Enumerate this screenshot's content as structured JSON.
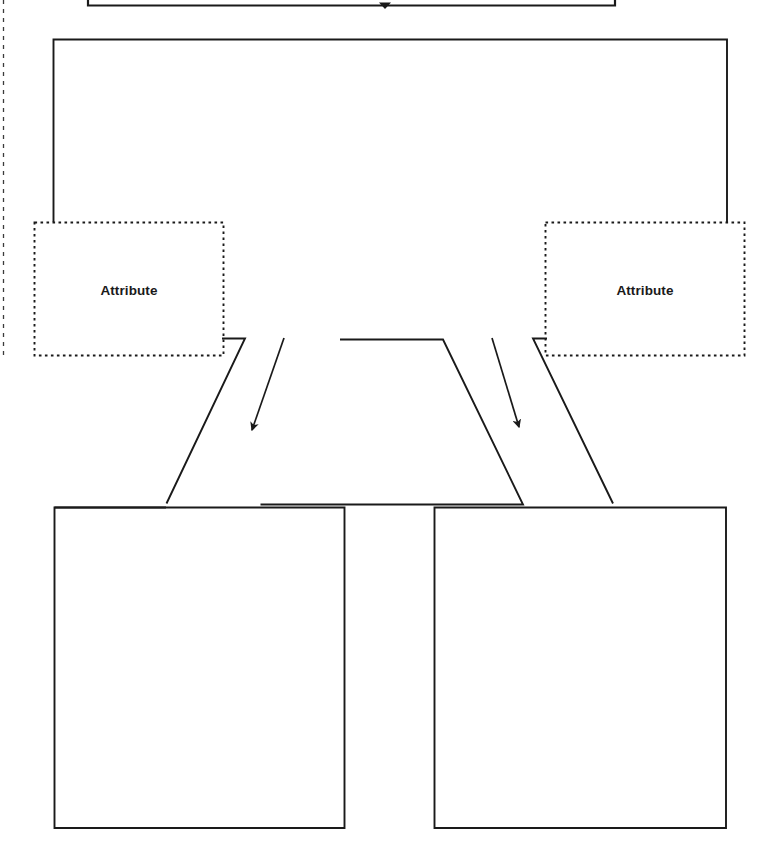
{
  "page": {
    "background_color": "#ffffff",
    "stroke_color": "#1a1a1a",
    "text_color": "#1a1a1a",
    "width": 771,
    "height": 858
  },
  "nodes": {
    "top_cropped_box": {
      "label": "",
      "border_style": "solid",
      "note": "bottom edge only, box cropped at top of image"
    },
    "parent_entity_box": {
      "label": "",
      "border_style": "solid"
    },
    "attribute_left": {
      "label": "Attribute",
      "border_style": "dotted"
    },
    "attribute_right": {
      "label": "Attribute",
      "border_style": "dotted"
    },
    "center_trapezoid": {
      "label": "",
      "border_style": "solid"
    },
    "child_entity_left": {
      "label": "",
      "border_style": "solid"
    },
    "child_entity_right": {
      "label": "",
      "border_style": "solid"
    }
  },
  "connectors": {
    "top_arrow": {
      "label": "",
      "arrowhead": "filled-triangle"
    },
    "stem_left": {
      "label": ""
    },
    "stem_right": {
      "label": ""
    },
    "arrow_left": {
      "label": "",
      "arrowhead": "filled-triangle"
    },
    "arrow_right": {
      "label": "",
      "arrowhead": "filled-triangle"
    },
    "edge_left_diagonal": {
      "label": ""
    },
    "edge_right_diagonal": {
      "label": ""
    },
    "page_margin_guide": {
      "label": "",
      "border_style": "dashed"
    }
  }
}
